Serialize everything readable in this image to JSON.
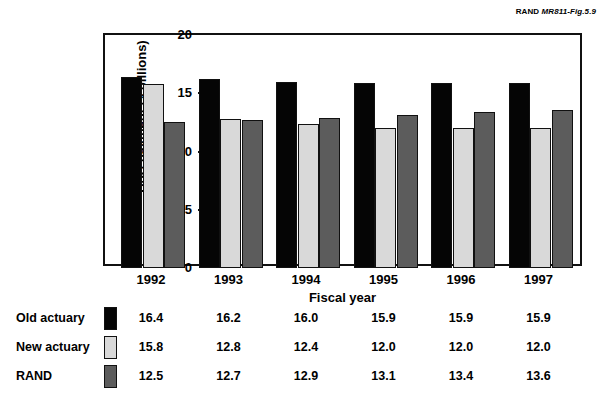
{
  "source_credit": {
    "prefix": "RAND ",
    "figure": "MR811-Fig.5.9"
  },
  "chart_data": {
    "type": "bar",
    "title": "",
    "xlabel": "Fiscal year",
    "ylabel": "DoD payment ($ billions)",
    "categories": [
      "1992",
      "1993",
      "1994",
      "1995",
      "1996",
      "1997"
    ],
    "ylim": [
      0,
      20
    ],
    "yticks": [
      0,
      5,
      10,
      15,
      20
    ],
    "ytick_labels": [
      "0",
      "5",
      "10",
      "15",
      "20"
    ],
    "grid": false,
    "legend_position": "below-table",
    "series": [
      {
        "name": "Old actuary",
        "color": "#050505",
        "values": [
          16.4,
          16.2,
          16.0,
          15.9,
          15.9,
          15.9
        ],
        "value_labels": [
          "16.4",
          "16.2",
          "16.0",
          "15.9",
          "15.9",
          "15.9"
        ]
      },
      {
        "name": "New actuary",
        "color": "#d9d9d9",
        "values": [
          15.8,
          12.8,
          12.4,
          12.0,
          12.0,
          12.0
        ],
        "value_labels": [
          "15.8",
          "12.8",
          "12.4",
          "12.0",
          "12.0",
          "12.0"
        ]
      },
      {
        "name": "RAND",
        "color": "#5c5c5c",
        "values": [
          12.5,
          12.7,
          12.9,
          13.1,
          13.4,
          13.6
        ],
        "value_labels": [
          "12.5",
          "12.7",
          "12.9",
          "13.1",
          "13.4",
          "13.6"
        ]
      }
    ]
  }
}
